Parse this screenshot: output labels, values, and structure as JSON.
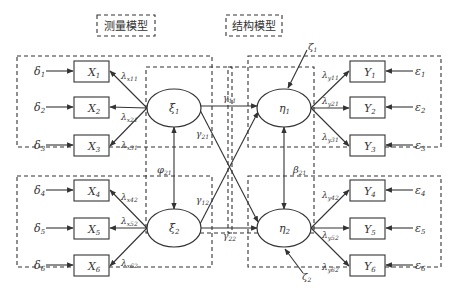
{
  "section_labels": {
    "measurement_model": "测量模型",
    "structural_model": "结构模型"
  },
  "exogenous": {
    "latent": [
      {
        "name": "ξ",
        "sub": "1"
      },
      {
        "name": "ξ",
        "sub": "2"
      }
    ],
    "indicators": [
      {
        "name": "X",
        "sub": "1",
        "error": "δ",
        "error_sub": "1",
        "loading": "λ",
        "loading_sub": "x11"
      },
      {
        "name": "X",
        "sub": "2",
        "error": "δ",
        "error_sub": "2",
        "loading": "λ",
        "loading_sub": "x21"
      },
      {
        "name": "X",
        "sub": "3",
        "error": "δ",
        "error_sub": "3",
        "loading": "λ",
        "loading_sub": "x31"
      },
      {
        "name": "X",
        "sub": "4",
        "error": "δ",
        "error_sub": "4",
        "loading": "λ",
        "loading_sub": "x42"
      },
      {
        "name": "X",
        "sub": "5",
        "error": "δ",
        "error_sub": "5",
        "loading": "λ",
        "loading_sub": "x52"
      },
      {
        "name": "X",
        "sub": "6",
        "error": "δ",
        "error_sub": "6",
        "loading": "λ",
        "loading_sub": "x62"
      }
    ],
    "covariance": {
      "name": "φ",
      "sub": "21"
    }
  },
  "endogenous": {
    "latent": [
      {
        "name": "η",
        "sub": "1",
        "disturbance": "ζ",
        "disturbance_sub": "1"
      },
      {
        "name": "η",
        "sub": "2",
        "disturbance": "ζ",
        "disturbance_sub": "2"
      }
    ],
    "indicators": [
      {
        "name": "Y",
        "sub": "1",
        "error": "ε",
        "error_sub": "1",
        "loading": "λ",
        "loading_sub": "y11"
      },
      {
        "name": "Y",
        "sub": "2",
        "error": "ε",
        "error_sub": "2",
        "loading": "λ",
        "loading_sub": "y21"
      },
      {
        "name": "Y",
        "sub": "3",
        "error": "ε",
        "error_sub": "3",
        "loading": "λ",
        "loading_sub": "y31"
      },
      {
        "name": "Y",
        "sub": "4",
        "error": "ε",
        "error_sub": "4",
        "loading": "λ",
        "loading_sub": "y42"
      },
      {
        "name": "Y",
        "sub": "5",
        "error": "ε",
        "error_sub": "5",
        "loading": "λ",
        "loading_sub": "y52"
      },
      {
        "name": "Y",
        "sub": "6",
        "error": "ε",
        "error_sub": "6",
        "loading": "λ",
        "loading_sub": "y62"
      }
    ],
    "relation": {
      "name": "β",
      "sub": "21"
    }
  },
  "paths": [
    {
      "name": "γ",
      "sub": "11"
    },
    {
      "name": "γ",
      "sub": "21"
    },
    {
      "name": "γ",
      "sub": "12"
    },
    {
      "name": "γ",
      "sub": "22"
    }
  ]
}
